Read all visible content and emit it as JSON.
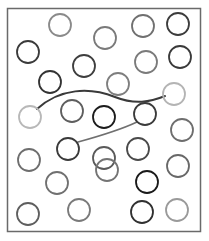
{
  "frame": {
    "x": 7.5,
    "y": 8.5,
    "width": 193,
    "height": 223,
    "stroke": "#6a6a6a",
    "stroke_width": 1.5
  },
  "circle_radius": 11,
  "circles": [
    {
      "cx": 60,
      "cy": 25,
      "color": "#8a8a8a"
    },
    {
      "cx": 105,
      "cy": 38,
      "color": "#7a7a7a"
    },
    {
      "cx": 143,
      "cy": 26,
      "color": "#707070"
    },
    {
      "cx": 178,
      "cy": 24,
      "color": "#3c3c3c"
    },
    {
      "cx": 28,
      "cy": 52,
      "color": "#3a3a3a"
    },
    {
      "cx": 84,
      "cy": 66,
      "color": "#3e3e3e"
    },
    {
      "cx": 146,
      "cy": 62,
      "color": "#7a7a7a"
    },
    {
      "cx": 180,
      "cy": 57,
      "color": "#3a3a3a"
    },
    {
      "cx": 50,
      "cy": 82,
      "color": "#333333"
    },
    {
      "cx": 118,
      "cy": 84,
      "color": "#7e7e7e"
    },
    {
      "cx": 174,
      "cy": 94,
      "color": "#b4b4b4"
    },
    {
      "cx": 30,
      "cy": 117,
      "color": "#b8b8b8"
    },
    {
      "cx": 72,
      "cy": 111,
      "color": "#5e5e5e"
    },
    {
      "cx": 104,
      "cy": 117,
      "color": "#1c1c1c"
    },
    {
      "cx": 145,
      "cy": 114,
      "color": "#3a3a3a"
    },
    {
      "cx": 182,
      "cy": 130,
      "color": "#6e6e6e"
    },
    {
      "cx": 68,
      "cy": 149,
      "color": "#3a3a3a"
    },
    {
      "cx": 104,
      "cy": 158,
      "color": "#5a5a5a"
    },
    {
      "cx": 138,
      "cy": 149,
      "color": "#4a4a4a"
    },
    {
      "cx": 29,
      "cy": 160,
      "color": "#6e6e6e"
    },
    {
      "cx": 57,
      "cy": 183,
      "color": "#707070"
    },
    {
      "cx": 107,
      "cy": 170,
      "color": "#747474"
    },
    {
      "cx": 147,
      "cy": 182,
      "color": "#1a1a1a"
    },
    {
      "cx": 178,
      "cy": 166,
      "color": "#686868"
    },
    {
      "cx": 28,
      "cy": 214,
      "color": "#5e5e5e"
    },
    {
      "cx": 79,
      "cy": 210,
      "color": "#7a7a7a"
    },
    {
      "cx": 142,
      "cy": 212,
      "color": "#303030"
    },
    {
      "cx": 177,
      "cy": 210,
      "color": "#9a9a9a"
    }
  ],
  "connectors": [
    {
      "name": "connector-upper",
      "d": "M 37 109 C 60 88, 90 87, 115 97 C 135 105, 150 102, 165 96",
      "color": "#3a3a3a",
      "width": 2
    },
    {
      "name": "connector-lower",
      "d": "M 78 142 C 100 136, 120 130, 137 122",
      "color": "#707070",
      "width": 1.6
    }
  ]
}
